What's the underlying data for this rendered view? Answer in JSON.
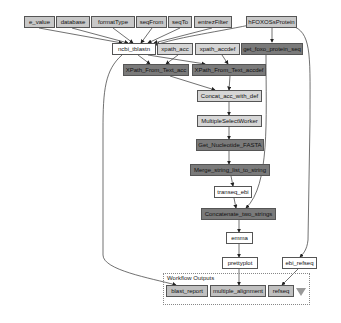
{
  "diagram": {
    "type": "workflow",
    "inputs": [
      {
        "id": "e_value",
        "label": "e_value"
      },
      {
        "id": "database",
        "label": "database"
      },
      {
        "id": "formatType",
        "label": "formatType"
      },
      {
        "id": "seqFrom",
        "label": "seqFrom"
      },
      {
        "id": "seqTo",
        "label": "seqTo"
      },
      {
        "id": "entrezFilter",
        "label": "entrezFilter"
      },
      {
        "id": "hFOXOSsProtein",
        "label": "hFOXOSsProtein"
      }
    ],
    "processors": [
      {
        "id": "ncbi_tblastn",
        "label": "ncbi_tblastn"
      },
      {
        "id": "xpath_acc",
        "label": "xpath_acc"
      },
      {
        "id": "xpath_accdef",
        "label": "xpath_accdef"
      },
      {
        "id": "get_foxo_protein_seq",
        "label": "get_foxo_protein_seq"
      },
      {
        "id": "XPath_From_Text_acc",
        "label": "XPath_From_Text_acc"
      },
      {
        "id": "XPath_From_Text_accdef",
        "label": "XPath_From_Text_accdef"
      },
      {
        "id": "Concat_acc_with_def",
        "label": "Concat_acc_with_def"
      },
      {
        "id": "MultipleSelectWorker",
        "label": "MultipleSelectWorker"
      },
      {
        "id": "Get_Nucleotide_FASTA",
        "label": "Get_Nucleotide_FASTA"
      },
      {
        "id": "Merge_string_list_to_string",
        "label": "Merge_string_list_to_string"
      },
      {
        "id": "transeq_ebi",
        "label": "transeq_ebi"
      },
      {
        "id": "Concatenate_two_strings",
        "label": "Concatenate_two_strings"
      },
      {
        "id": "emma",
        "label": "emma"
      },
      {
        "id": "prettyplot",
        "label": "prettyplot"
      },
      {
        "id": "ebi_refseq",
        "label": "ebi_refseq"
      }
    ],
    "outputs_group": {
      "label": "Workflow Outputs",
      "outputs": [
        {
          "id": "blast_report",
          "label": "blast_report"
        },
        {
          "id": "multiple_alignment",
          "label": "multiple_alignment"
        },
        {
          "id": "refseq",
          "label": "refseq"
        }
      ]
    },
    "edges": [
      [
        "e_value",
        "ncbi_tblastn"
      ],
      [
        "database",
        "ncbi_tblastn"
      ],
      [
        "formatType",
        "ncbi_tblastn"
      ],
      [
        "seqFrom",
        "ncbi_tblastn"
      ],
      [
        "seqTo",
        "ncbi_tblastn"
      ],
      [
        "entrezFilter",
        "ncbi_tblastn"
      ],
      [
        "hFOXOSsProtein",
        "ncbi_tblastn"
      ],
      [
        "hFOXOSsProtein",
        "get_foxo_protein_seq"
      ],
      [
        "hFOXOSsProtein",
        "ebi_refseq"
      ],
      [
        "ncbi_tblastn",
        "XPath_From_Text_acc"
      ],
      [
        "ncbi_tblastn",
        "XPath_From_Text_accdef"
      ],
      [
        "ncbi_tblastn",
        "blast_report"
      ],
      [
        "xpath_acc",
        "XPath_From_Text_acc"
      ],
      [
        "xpath_accdef",
        "XPath_From_Text_accdef"
      ],
      [
        "XPath_From_Text_acc",
        "Concat_acc_with_def"
      ],
      [
        "XPath_From_Text_accdef",
        "Concat_acc_with_def"
      ],
      [
        "Concat_acc_with_def",
        "MultipleSelectWorker"
      ],
      [
        "MultipleSelectWorker",
        "Get_Nucleotide_FASTA"
      ],
      [
        "Get_Nucleotide_FASTA",
        "Merge_string_list_to_string"
      ],
      [
        "Merge_string_list_to_string",
        "transeq_ebi"
      ],
      [
        "transeq_ebi",
        "Concatenate_two_strings"
      ],
      [
        "get_foxo_protein_seq",
        "Concatenate_two_strings"
      ],
      [
        "Concatenate_two_strings",
        "emma"
      ],
      [
        "emma",
        "prettyplot"
      ],
      [
        "prettyplot",
        "multiple_alignment"
      ],
      [
        "ebi_refseq",
        "refseq"
      ]
    ],
    "colors": {
      "input": "#c8c8c8",
      "light_processor": "#d6d6d6",
      "dark_processor": "#7a7a7a",
      "white_processor": "#ffffff",
      "output": "#c0c0c0",
      "edge": "#333333"
    }
  }
}
